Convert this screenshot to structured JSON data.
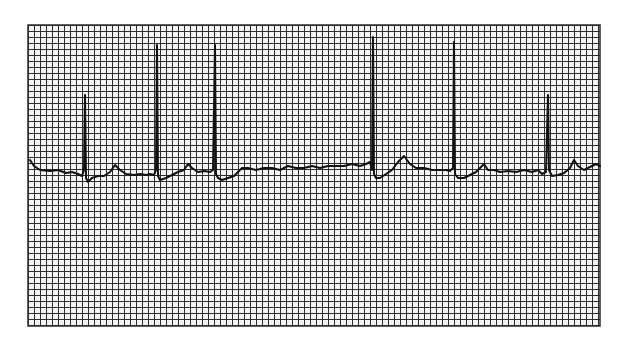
{
  "figure": {
    "background_color": "#ffffff",
    "grid_color": "#333333",
    "paper_color": "#f2f2f2",
    "trace_color": "#111111",
    "grid": {
      "x": 28,
      "y": 25,
      "width": 572,
      "height": 301,
      "pitch": 6
    },
    "baseline_y": 170,
    "beats": [
      {
        "r_x": 85,
        "r_top": 95,
        "s_bottom": 182
      },
      {
        "r_x": 157,
        "r_top": 45,
        "s_bottom": 180
      },
      {
        "r_x": 215,
        "r_top": 45,
        "s_bottom": 178
      },
      {
        "r_x": 373,
        "r_top": 37,
        "s_bottom": 180
      },
      {
        "r_x": 454,
        "r_top": 42,
        "s_bottom": 180
      },
      {
        "r_x": 548,
        "r_top": 95,
        "s_bottom": 180
      }
    ],
    "trace_points": "30,160 34,166 40,170 50,171 58,170 66,173 72,172 78,174 82,176 84,170 85,95 86,178 88,182 92,178 98,176 104,176 110,172 115,165 120,170 126,174 134,175 140,174 146,175 150,174 154,175 156,170 157,45 158,176 160,180 166,178 172,175 178,172 184,170 188,164 192,168 198,172 204,171 210,172 213,170 215,45 216,174 218,178 222,180 228,178 234,176 238,172 242,168 248,168 256,170 264,168 272,168 280,170 288,166 296,168 304,168 312,166 320,168 328,166 336,166 344,166 352,164 360,166 366,164 370,162 372,170 373,37 374,174 376,178 380,178 386,174 392,170 398,162 404,156 410,164 416,168 424,168 432,170 440,170 446,170 450,171 453,168 454,42 455,174 458,178 464,178 470,175 476,172 480,168 484,164 488,170 494,170 500,172 508,171 516,172 524,170 532,172 538,170 542,174 546,172 548,95 549,170 552,176 558,175 564,173 570,168 574,160 578,166 584,170 590,167 596,164 600,166"
  }
}
